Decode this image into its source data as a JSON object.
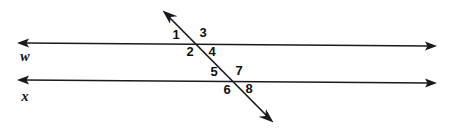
{
  "figure": {
    "background_color": "#ffffff",
    "stroke_color": "#1a1a1a",
    "text_color": "#101010",
    "width": 450,
    "height": 128
  },
  "lines": [
    {
      "id": "w",
      "label": "w",
      "role": "parallel-line",
      "label_x": 25,
      "label_y": 58,
      "x1": 18,
      "y1": 43,
      "x2": 436,
      "y2": 46,
      "arrow_start": true,
      "arrow_end": true
    },
    {
      "id": "x",
      "label": "x",
      "role": "parallel-line",
      "label_x": 25,
      "label_y": 98,
      "x1": 18,
      "y1": 80,
      "x2": 436,
      "y2": 83,
      "arrow_start": true,
      "arrow_end": true
    },
    {
      "id": "transversal",
      "label": "",
      "role": "transversal",
      "x1": 163,
      "y1": 11,
      "x2": 273,
      "y2": 122,
      "arrow_start": true,
      "arrow_end": true
    }
  ],
  "intersections": [
    {
      "id": "upper",
      "with": "w",
      "x": 197,
      "y": 44
    },
    {
      "id": "lower",
      "with": "x",
      "x": 233,
      "y": 81
    }
  ],
  "angle_labels": [
    {
      "id": "1",
      "text": "1",
      "x": 176,
      "y": 36,
      "intersection": "upper",
      "position": "upper-left"
    },
    {
      "id": "3",
      "text": "3",
      "x": 203,
      "y": 34,
      "intersection": "upper",
      "position": "upper-right"
    },
    {
      "id": "2",
      "text": "2",
      "x": 190,
      "y": 53,
      "intersection": "upper",
      "position": "lower-left"
    },
    {
      "id": "4",
      "text": "4",
      "x": 212,
      "y": 53,
      "intersection": "upper",
      "position": "lower-right"
    },
    {
      "id": "5",
      "text": "5",
      "x": 214,
      "y": 73,
      "intersection": "lower",
      "position": "upper-left"
    },
    {
      "id": "7",
      "text": "7",
      "x": 239,
      "y": 72,
      "intersection": "lower",
      "position": "upper-right"
    },
    {
      "id": "6",
      "text": "6",
      "x": 227,
      "y": 91,
      "intersection": "lower",
      "position": "lower-left"
    },
    {
      "id": "8",
      "text": "8",
      "x": 249,
      "y": 90,
      "intersection": "lower",
      "position": "lower-right"
    }
  ]
}
